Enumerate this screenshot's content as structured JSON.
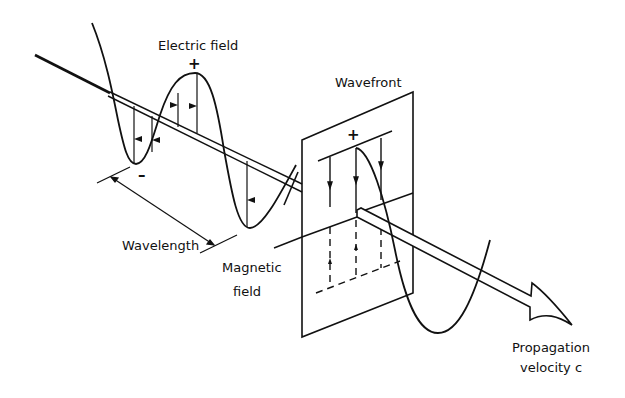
{
  "diagram": {
    "labels": {
      "electric_field": "Electric field",
      "wavefront": "Wavefront",
      "wavelength": "Wavelength",
      "magnetic_field_line1": "Magnetic",
      "magnetic_field_line2": "field",
      "propagation_line1": "Propagation",
      "propagation_line2": "velocity c",
      "plus_sign": "+",
      "minus_sign": "–",
      "plane_plus_sign": "+"
    },
    "colors": {
      "stroke": "#111111",
      "background": "#ffffff"
    }
  }
}
